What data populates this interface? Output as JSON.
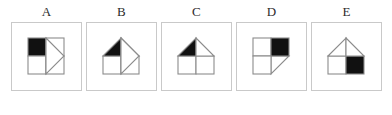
{
  "figure": {
    "type": "multiple-choice-shape-options",
    "option_count": 5,
    "stroke_color": "#8c8c8c",
    "fill_black": "#111111",
    "fill_white": "#ffffff",
    "panel_border_color": "#c9c9c9",
    "background_color": "#ffffff"
  },
  "options": [
    {
      "label": "A",
      "description": "Two-by-two square grid with the top-left cell filled black, and a right-pointing triangle attached to the right edge spanning the full height.",
      "shaded_cell": "top-left",
      "triangle": "right-pointing-on-right-edge"
    },
    {
      "label": "B",
      "description": "Square base split by a vertical line with a triangular roof whose left half is black, and a right-pointing triangle attached to the right side.",
      "shaded_cell": "roof-left",
      "triangle": "right-pointing-on-right-edge"
    },
    {
      "label": "C",
      "description": "House shape: square base split by a vertical line with a triangular roof whose left half is black.",
      "shaded_cell": "roof-left",
      "triangle": "none"
    },
    {
      "label": "D",
      "description": "Two-by-two square grid with the top-right cell filled black, and a right triangle attached at the lower right pointing down-right.",
      "shaded_cell": "top-right",
      "triangle": "lower-right-diagonal"
    },
    {
      "label": "E",
      "description": "House shape: white triangular roof with a centre vertical line, square base whose right half is filled black.",
      "shaded_cell": "base-right",
      "triangle": "none"
    }
  ]
}
